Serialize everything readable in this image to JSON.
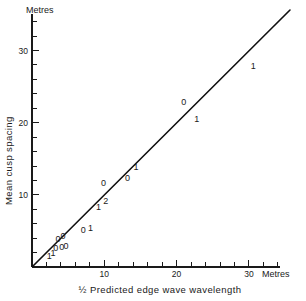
{
  "chart_data": {
    "type": "scatter",
    "title": "",
    "xlabel": "½  Predicted edge wave wavelength",
    "ylabel": "Mean cusp spacing",
    "x_unit_label": "Metres",
    "y_unit_label": "Metres",
    "xlim": [
      0,
      34
    ],
    "ylim": [
      0,
      36
    ],
    "x_major_ticks": [
      10,
      20,
      30
    ],
    "y_major_ticks": [
      10,
      20,
      30
    ],
    "x_major_tick_labels": [
      "10",
      "20",
      "30"
    ],
    "y_major_tick_labels": [
      "10",
      "20",
      "30"
    ],
    "x_minor_tick_step": 2,
    "y_minor_tick_step": 2,
    "grid": false,
    "legend": "none",
    "reference_line": {
      "label": "1:1 line",
      "x_start": 0,
      "y_start": 0,
      "x_end": 33.5,
      "y_end": 33.8
    },
    "marker_style_note": "data points drawn as small typewriter glyphs: '0' rings and '1' vertical strokes; one '2' indicates two coincident points",
    "points": [
      {
        "glyph": "1",
        "x": 2.4,
        "y": 1.6
      },
      {
        "glyph": "1",
        "x": 2.9,
        "y": 1.9
      },
      {
        "glyph": "0",
        "x": 3.3,
        "y": 2.7
      },
      {
        "glyph": "0",
        "x": 4.1,
        "y": 2.8
      },
      {
        "glyph": "0",
        "x": 4.7,
        "y": 2.9
      },
      {
        "glyph": "0",
        "x": 3.6,
        "y": 3.9
      },
      {
        "glyph": "0",
        "x": 4.3,
        "y": 4.3
      },
      {
        "glyph": "0",
        "x": 7.1,
        "y": 5.2
      },
      {
        "glyph": "1",
        "x": 8.1,
        "y": 5.4
      },
      {
        "glyph": "1",
        "x": 9.2,
        "y": 8.3
      },
      {
        "glyph": "2",
        "x": 10.2,
        "y": 9.2
      },
      {
        "glyph": "0",
        "x": 9.9,
        "y": 11.7
      },
      {
        "glyph": "0",
        "x": 13.2,
        "y": 12.3
      },
      {
        "glyph": "1",
        "x": 14.4,
        "y": 13.9
      },
      {
        "glyph": "0",
        "x": 21.0,
        "y": 22.9
      },
      {
        "glyph": "1",
        "x": 22.8,
        "y": 20.5
      },
      {
        "glyph": "1",
        "x": 30.6,
        "y": 27.9
      }
    ]
  },
  "axes": {
    "y_unit": "Metres",
    "x_unit": "Metres",
    "y_title": "Mean cusp spacing",
    "x_title_fraction": "1/2",
    "x_title_text": "Predicted edge wave wavelength"
  }
}
